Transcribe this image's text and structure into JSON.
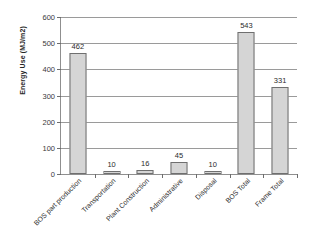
{
  "chart_data": {
    "type": "bar",
    "title": "",
    "subtitle": "",
    "xlabel": "",
    "ylabel": "Energy Use (MJ/m2)",
    "ylim": [
      0,
      600
    ],
    "ytick_step": 100,
    "yticks": [
      600,
      500,
      400,
      300,
      200,
      100,
      0
    ],
    "grid": true,
    "legend": false,
    "legend_position": "none",
    "annotations": [],
    "bar_fill_color": "#d5d5d5",
    "bar_border_color": "#6f6f6f",
    "axis_color": "#8f8f8f",
    "gridline_color": "#9a9a9a",
    "categories": [
      "BOS part production",
      "Transportation",
      "Plant Construction",
      "Administrative",
      "Disposal",
      "BOS Total",
      "Frame Total"
    ],
    "values": [
      462,
      10,
      16,
      45,
      10,
      543,
      331
    ],
    "data_labels": [
      "462",
      "10",
      "16",
      "45",
      "10",
      "543",
      "331"
    ]
  }
}
